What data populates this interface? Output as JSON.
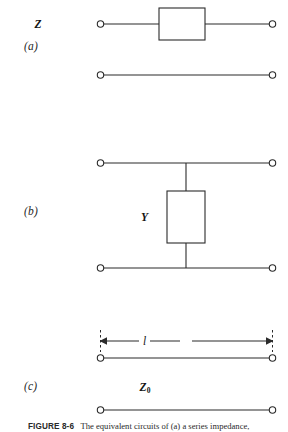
{
  "figure": {
    "caption_number": "FIGURE 8-6",
    "caption_text": "The equivalent circuits of (a) a series impedance,",
    "background_color": "#ffffff",
    "line_color": "#2b2b2b"
  },
  "panels": [
    {
      "id": "a",
      "label": "(a)",
      "element_label": "Z",
      "element_name": "series-impedance",
      "topology": "series-element-two-port",
      "terminals": 4
    },
    {
      "id": "b",
      "label": "(b)",
      "element_label": "Y",
      "element_name": "shunt-admittance",
      "topology": "shunt-element-two-port",
      "terminals": 4
    },
    {
      "id": "c",
      "label": "(c)",
      "element_label": "Z",
      "element_subscript": "0",
      "element_name": "transmission-line",
      "length_label": "l",
      "topology": "transmission-line-two-port",
      "terminals": 4
    }
  ],
  "geometry": {
    "left_terminal_x": 100,
    "right_terminal_x": 273,
    "panel_a": {
      "top_wire_y": 24,
      "bottom_wire_y": 75,
      "box_x": 159,
      "box_y": 8,
      "box_w": 46,
      "box_h": 32
    },
    "panel_b": {
      "top_wire_y": 163,
      "bottom_wire_y": 268,
      "box_x": 167,
      "box_y": 191,
      "box_w": 38,
      "box_h": 52,
      "stub_x": 186
    },
    "panel_c": {
      "top_wire_y": 358,
      "bottom_wire_y": 410,
      "dim_line_y": 341
    }
  }
}
